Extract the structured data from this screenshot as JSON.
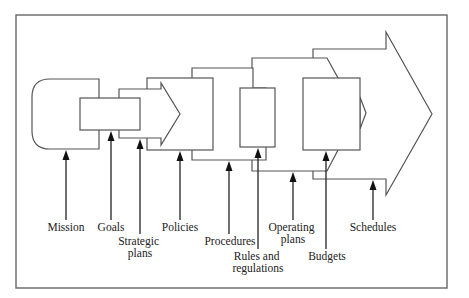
{
  "diagram": {
    "labels": {
      "mission": [
        "Mission"
      ],
      "goals": [
        "Goals"
      ],
      "strategic_plans": [
        "Strategic",
        "plans"
      ],
      "policies": [
        "Policies"
      ],
      "procedures": [
        "Procedures"
      ],
      "rules_and_regulations": [
        "Rules and",
        "regulations"
      ],
      "operating_plans": [
        "Operating",
        "plans"
      ],
      "budgets": [
        "Budgets"
      ],
      "schedules": [
        "Schedules"
      ]
    },
    "colors": {
      "outline": "#555555",
      "arrow": "#111111",
      "text": "#222222",
      "background": "#ffffff"
    }
  }
}
